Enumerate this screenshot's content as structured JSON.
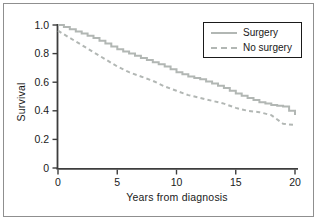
{
  "figure": {
    "background": "#ffffff",
    "frame_color": "#8f8f8f",
    "axis_color": "#3d3d3d",
    "text_color": "#1a1a1a",
    "curve_color": "#b2b7b4"
  },
  "chart_data": {
    "type": "line",
    "title": "",
    "xlabel": "Years from diagnosis",
    "ylabel": "Survival",
    "xlim": [
      0,
      20
    ],
    "ylim": [
      0,
      1.0
    ],
    "x_ticks": [
      0,
      5,
      10,
      15,
      20
    ],
    "y_ticks": [
      {
        "label": "1.0",
        "value": 1.0
      },
      {
        "label": "0.8",
        "value": 0.8
      },
      {
        "label": "0.6",
        "value": 0.6
      },
      {
        "label": "0.4",
        "value": 0.4
      },
      {
        "label": "0.2",
        "value": 0.2
      },
      {
        "label": "0",
        "value": 0
      }
    ],
    "grid": false,
    "legend_position": "top-right",
    "x": [
      0,
      1,
      2,
      3,
      4,
      5,
      6,
      7,
      8,
      9,
      10,
      11,
      12,
      13,
      14,
      15,
      16,
      17,
      18,
      19,
      20
    ],
    "series": [
      {
        "name": "Surgery",
        "style": "solid",
        "color": "#b2b7b4",
        "values": [
          1.0,
          0.97,
          0.94,
          0.91,
          0.87,
          0.83,
          0.8,
          0.77,
          0.74,
          0.71,
          0.67,
          0.64,
          0.62,
          0.59,
          0.56,
          0.52,
          0.49,
          0.46,
          0.44,
          0.43,
          0.37
        ]
      },
      {
        "name": "No surgery",
        "style": "dashed",
        "color": "#b2b7b4",
        "values": [
          0.96,
          0.91,
          0.86,
          0.81,
          0.76,
          0.71,
          0.67,
          0.64,
          0.61,
          0.57,
          0.54,
          0.51,
          0.49,
          0.47,
          0.45,
          0.42,
          0.4,
          0.39,
          0.37,
          0.31,
          0.3
        ]
      }
    ]
  }
}
